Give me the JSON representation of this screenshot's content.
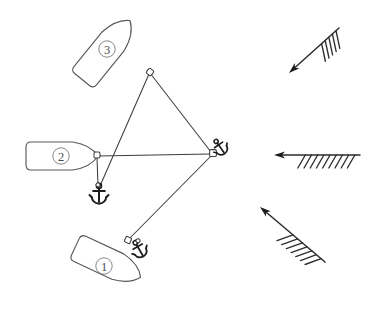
{
  "figure": {
    "kind": "moored-vessel-diagram",
    "background_color": "#ffffff",
    "line_color": "#3a3d40",
    "hull_stroke_color": "#555a5e",
    "label_color": "#4a4e52",
    "arrow_color": "#2b2d30",
    "width": 388,
    "height": 313
  },
  "mooring_point": {
    "name": "central-mooring-buoy",
    "x": 213,
    "y": 153,
    "icon": "anchor-icon",
    "icon_glyph": "⚓",
    "rotation_deg": -35
  },
  "vessels": [
    {
      "id": "vessel-1",
      "label": "1",
      "label_x": 104,
      "label_y": 266,
      "bow_x": 128,
      "bow_y": 240,
      "angle_deg": 25,
      "length": 72,
      "beam": 28,
      "center_x": 108,
      "center_y": 262,
      "has_own_anchor": true,
      "anchor": {
        "name": "vessel-1-anchor-icon",
        "glyph": "⚓",
        "x": 139,
        "y": 249,
        "rotation_deg": -30,
        "size": 17
      }
    },
    {
      "id": "vessel-2",
      "label": "2",
      "label_x": 61,
      "label_y": 156,
      "bow_x": 97,
      "bow_y": 155,
      "angle_deg": 0,
      "length": 72,
      "beam": 28,
      "center_x": 62,
      "center_y": 156,
      "has_own_anchor": true,
      "anchor": {
        "name": "vessel-2-anchor-icon",
        "glyph": "⚓",
        "x": 99,
        "y": 194,
        "rotation_deg": 0,
        "size": 19
      }
    },
    {
      "id": "vessel-3",
      "label": "3",
      "label_x": 107,
      "label_y": 49,
      "bow_x": 150,
      "bow_y": 72,
      "angle_deg": -51,
      "length": 76,
      "beam": 29,
      "center_x": 106,
      "center_y": 50,
      "has_own_anchor": false,
      "anchor": null
    }
  ],
  "mooring_lines": [
    {
      "name": "line-vessel3-to-buoy",
      "from": "vessel-3-bow",
      "to": "central-mooring-buoy",
      "x1": 150,
      "y1": 73,
      "x2": 211,
      "y2": 152
    },
    {
      "name": "line-vessel3-to-anchor2",
      "from": "vessel-3-bow",
      "to": "vessel-2-anchor",
      "x1": 149,
      "y1": 74,
      "x2": 100,
      "y2": 186
    },
    {
      "name": "line-vessel2-to-buoy",
      "from": "vessel-2-bow",
      "to": "central-mooring-buoy",
      "x1": 98,
      "y1": 156,
      "x2": 210,
      "y2": 154
    },
    {
      "name": "line-vessel2-to-anchor",
      "from": "vessel-2-bow",
      "to": "vessel-2-anchor",
      "x1": 97,
      "y1": 157,
      "x2": 98,
      "y2": 186
    },
    {
      "name": "line-vessel1-to-buoy",
      "from": "vessel-1-bow",
      "to": "central-mooring-buoy",
      "x1": 129,
      "y1": 239,
      "x2": 211,
      "y2": 156
    }
  ],
  "wind_barbs": [
    {
      "id": "wind-barb-upper",
      "name": "wind-barb-arrow-upper",
      "tail_x": 339,
      "tail_y": 28,
      "head_x": 289,
      "head_y": 73,
      "barb_count": 5,
      "barb_length": 18,
      "direction_label": "down-left"
    },
    {
      "id": "wind-barb-middle",
      "name": "wind-barb-arrow-middle",
      "tail_x": 360,
      "tail_y": 155,
      "head_x": 274,
      "head_y": 155,
      "barb_count": 9,
      "barb_length": 15,
      "direction_label": "left"
    },
    {
      "id": "wind-barb-lower",
      "name": "wind-barb-arrow-lower",
      "tail_x": 325,
      "tail_y": 262,
      "head_x": 260,
      "head_y": 207,
      "barb_count": 7,
      "barb_length": 17,
      "direction_label": "up-left"
    }
  ]
}
